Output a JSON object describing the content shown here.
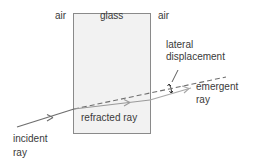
{
  "diagram": {
    "labels": {
      "air_left": "air",
      "glass": "glass",
      "air_right": "air",
      "lateral_line1": "lateral",
      "lateral_line2": "displacement",
      "emergent_line1": "emergent",
      "emergent_line2": "ray",
      "incident_line1": "incident",
      "incident_line2": "ray",
      "refracted": "refracted ray"
    },
    "colors": {
      "block_fill": "#f2f2f2",
      "block_border": "#8a8a8a",
      "incident_ray": "#6e6e6e",
      "refracted_ray": "#9a9a9a",
      "emergent_ray": "#a8a8a8",
      "dashed_extension": "#6e6e6e",
      "text": "#3a3a3a"
    },
    "elements": [
      "glass-block",
      "incident-ray",
      "refracted-ray",
      "emergent-ray",
      "dashed-extension",
      "lateral-displacement-marker"
    ]
  }
}
